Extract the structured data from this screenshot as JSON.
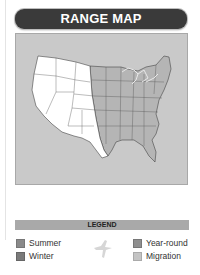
{
  "header": {
    "title": "RANGE MAP"
  },
  "map": {
    "background_color": "#c9c9c9",
    "state_fill_default": "#ffffff",
    "state_fill_range": "#b5b5b5",
    "great_lakes_color": "#e8e8e8"
  },
  "legend": {
    "title": "LEGEND",
    "items": [
      {
        "label": "Summer",
        "color": "#8a8a8a"
      },
      {
        "label": "Winter",
        "color": "#7a7a7a"
      },
      {
        "label": "Year-round",
        "color": "#8f8f8f"
      },
      {
        "label": "Migration",
        "color": "#c4c4c4"
      }
    ],
    "bird_icon": "bird-silhouette-icon"
  }
}
